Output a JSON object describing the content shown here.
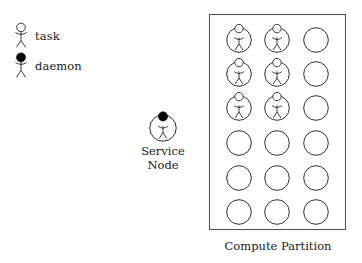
{
  "diagram": {
    "title_caption": "Compute Partition",
    "background_color": "#ffffff",
    "ink_color": "#1a1a1a",
    "box_stroke_color": "#555555"
  },
  "legend": {
    "items": [
      {
        "label": "task",
        "icon": "stick-figure-open-head",
        "head_fill": "#ffffff"
      },
      {
        "label": "daemon",
        "icon": "stick-figure-filled-head",
        "head_fill": "#000000"
      }
    ]
  },
  "service_node": {
    "label_line1": "Service",
    "label_line2": "Node",
    "occupant": "daemon",
    "occupant_head_fill": "#000000"
  },
  "compute_partition": {
    "caption": "Compute Partition",
    "rows": 6,
    "columns": 3,
    "total_nodes": 18,
    "occupied_nodes": 6,
    "empty_nodes": 12,
    "occupant_type": "task",
    "occupant_head_fill": "#ffffff",
    "grid": [
      [
        "task",
        "task",
        "empty"
      ],
      [
        "task",
        "task",
        "empty"
      ],
      [
        "task",
        "task",
        "empty"
      ],
      [
        "empty",
        "empty",
        "empty"
      ],
      [
        "empty",
        "empty",
        "empty"
      ],
      [
        "empty",
        "empty",
        "empty"
      ]
    ]
  }
}
